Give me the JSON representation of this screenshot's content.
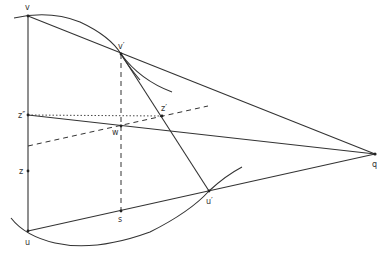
{
  "diagram": {
    "type": "geometric-construction",
    "points": {
      "v": {
        "label": "v",
        "x": 28,
        "y": 16
      },
      "vp": {
        "label": "v′",
        "x": 121,
        "y": 54
      },
      "zpp": {
        "label": "z″",
        "x": 28,
        "y": 115
      },
      "w": {
        "label": "w",
        "x": 121,
        "y": 126
      },
      "zp": {
        "label": "z′",
        "x": 162,
        "y": 116
      },
      "z": {
        "label": "z",
        "x": 28,
        "y": 171
      },
      "s": {
        "label": "s",
        "x": 121,
        "y": 211
      },
      "up": {
        "label": "u′",
        "x": 209,
        "y": 191
      },
      "u": {
        "label": "u",
        "x": 28,
        "y": 231
      },
      "q": {
        "label": "q",
        "x": 375,
        "y": 154
      }
    },
    "labels": {
      "v": "v",
      "vp": "v′",
      "zpp": "z″",
      "w": "w",
      "zp": "z′",
      "z": "z",
      "s": "s",
      "up": "u′",
      "u": "u",
      "q": "q"
    },
    "lines": [
      {
        "from": "v",
        "to": "u",
        "style": "solid"
      },
      {
        "from": "v",
        "to": "q",
        "style": "solid"
      },
      {
        "from": "zpp",
        "to": "q",
        "style": "solid"
      },
      {
        "from": "u",
        "to": "q",
        "style": "solid"
      },
      {
        "from": "vp",
        "to": "up",
        "style": "solid"
      },
      {
        "from": "vp",
        "to": "s",
        "style": "dashed"
      },
      {
        "from": "zpp",
        "to": "zp",
        "style": "dotted"
      },
      {
        "from": "dashed-transversal",
        "style": "dashed"
      }
    ],
    "curves": [
      "upper-arc through v and v′",
      "lower-arc through u and u′"
    ]
  }
}
